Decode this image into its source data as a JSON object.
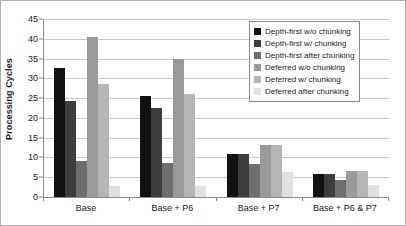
{
  "chart_data": {
    "type": "bar",
    "title": "",
    "xlabel": "",
    "ylabel": "Processing Cycles",
    "ylim": [
      0,
      45
    ],
    "ytick_step": 5,
    "yticks": [
      0,
      5,
      10,
      15,
      20,
      25,
      30,
      35,
      40,
      45
    ],
    "grid": true,
    "legend_position": "top-right",
    "categories": [
      "Base",
      "Base + P6",
      "Base + P7",
      "Base + P6 & P7"
    ],
    "series": [
      {
        "name": "Depth-first w/o chunking",
        "color": "#111111",
        "values": [
          32.5,
          25.6,
          11.0,
          5.9
        ]
      },
      {
        "name": "Depth-first w/ chunking",
        "color": "#3d3d3d",
        "values": [
          24.2,
          22.6,
          10.9,
          5.9
        ]
      },
      {
        "name": "Depth-first after chunking",
        "color": "#6e6e6e",
        "values": [
          9.2,
          8.7,
          8.3,
          4.4
        ]
      },
      {
        "name": "Deferred w/o chunking",
        "color": "#9a9a9a",
        "values": [
          40.4,
          35.0,
          13.1,
          6.7
        ]
      },
      {
        "name": "Deferred w/ chunking",
        "color": "#b5b5b5",
        "values": [
          28.5,
          26.1,
          13.1,
          6.5
        ]
      },
      {
        "name": "Deferred after chunking",
        "color": "#e0e0e0",
        "values": [
          2.9,
          2.9,
          6.3,
          3.0
        ]
      }
    ]
  },
  "axis": {
    "y_title": "Processing Cycles"
  }
}
